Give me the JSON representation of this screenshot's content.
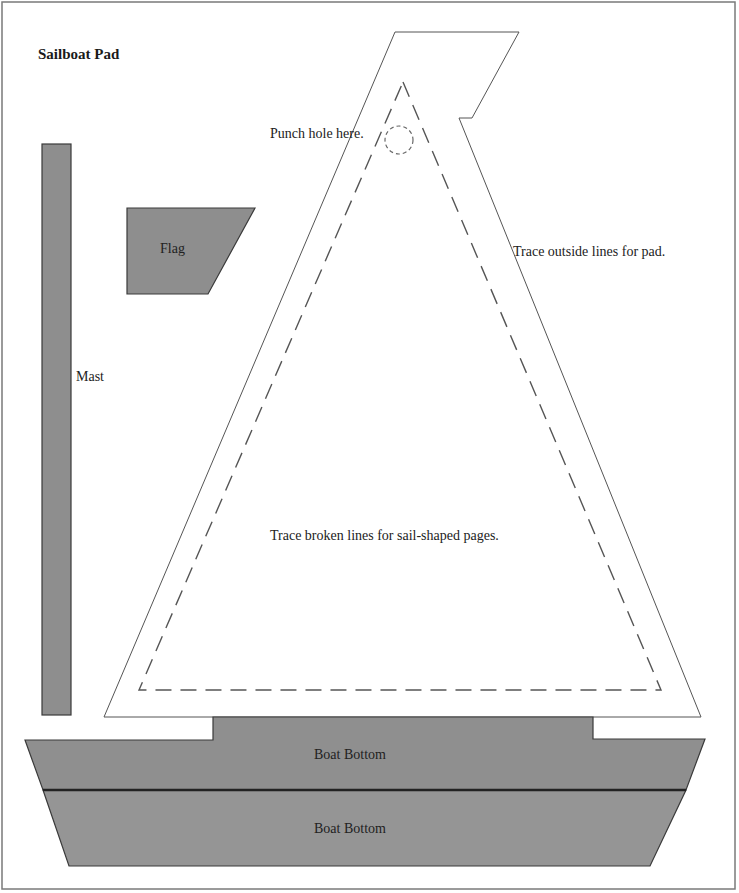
{
  "title": "Sailboat Pad",
  "pieces": {
    "mast": {
      "label": "Mast"
    },
    "flag": {
      "label": "Flag"
    },
    "sail": {
      "punch_note": "Punch hole here.",
      "outside_note": "Trace outside lines for pad.",
      "broken_note": "Trace broken lines for sail-shaped pages."
    },
    "boat_bottom_1": {
      "label": "Boat Bottom"
    },
    "boat_bottom_2": {
      "label": "Boat Bottom"
    }
  },
  "colors": {
    "piece_fill": "#8e8e8e",
    "piece_stroke": "#3a3a3a",
    "sail_fill": "#ffffff",
    "border": "#7a7a7a"
  }
}
